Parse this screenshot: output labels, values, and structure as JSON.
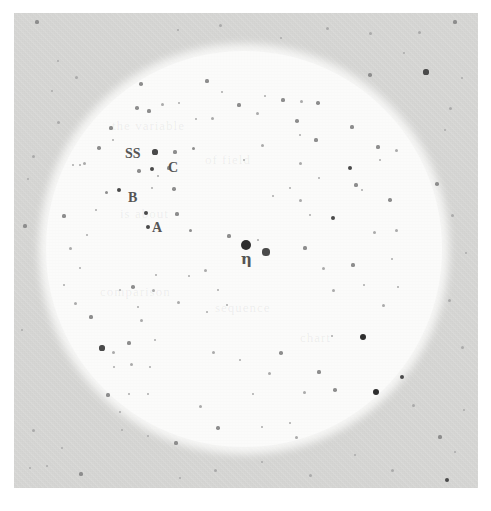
{
  "figure": {
    "kind": "astronomical-finder-chart",
    "background_color": "#d6d6d4",
    "field_color": "#fbfbfa",
    "star_color": "#4a4a4a",
    "label_color": "#555555"
  },
  "plate": {
    "left": 14,
    "top": 13,
    "width": 464,
    "height": 475
  },
  "field_of_view": {
    "center_x": 244,
    "center_y": 249,
    "radius": 198
  },
  "labels": [
    {
      "id": "ss",
      "text": "SS",
      "x": 125,
      "y": 147,
      "class": "label-ss"
    },
    {
      "id": "c",
      "text": "C",
      "x": 168,
      "y": 161,
      "class": "label-c"
    },
    {
      "id": "b",
      "text": "B",
      "x": 128,
      "y": 191,
      "class": "label-b"
    },
    {
      "id": "a",
      "text": "A",
      "x": 152,
      "y": 221,
      "class": "label-a"
    },
    {
      "id": "eta",
      "text": "η",
      "x": 241,
      "y": 252,
      "class": "label-eta"
    }
  ],
  "ghost_text": [
    {
      "text": "the variable",
      "x": 112,
      "y": 118,
      "rotate": 0
    },
    {
      "text": "of field",
      "x": 205,
      "y": 152,
      "rotate": 0
    },
    {
      "text": "is about",
      "x": 120,
      "y": 206,
      "rotate": 0
    },
    {
      "text": "comparison",
      "x": 100,
      "y": 284,
      "rotate": 0
    },
    {
      "text": "sequence",
      "x": 215,
      "y": 300,
      "rotate": 0
    },
    {
      "text": "chart",
      "x": 300,
      "y": 330,
      "rotate": 0
    }
  ],
  "stars": [
    {
      "x": 246,
      "y": 245,
      "r": 5.0,
      "mag": "bright"
    },
    {
      "x": 266,
      "y": 252,
      "r": 3.6,
      "mag": "normal"
    },
    {
      "x": 229,
      "y": 236,
      "r": 1.6,
      "mag": "dim"
    },
    {
      "x": 258,
      "y": 240,
      "r": 1.4,
      "mag": "faint"
    },
    {
      "x": 155,
      "y": 152,
      "r": 2.6,
      "mag": "normal"
    },
    {
      "x": 175,
      "y": 152,
      "r": 1.6,
      "mag": "dim"
    },
    {
      "x": 193,
      "y": 148,
      "r": 1.5,
      "mag": "dim"
    },
    {
      "x": 169,
      "y": 168,
      "r": 1.6,
      "mag": "dim"
    },
    {
      "x": 152,
      "y": 169,
      "r": 2.0,
      "mag": "normal"
    },
    {
      "x": 139,
      "y": 171,
      "r": 1.7,
      "mag": "dim"
    },
    {
      "x": 158,
      "y": 176,
      "r": 1.3,
      "mag": "faint"
    },
    {
      "x": 119,
      "y": 190,
      "r": 2.1,
      "mag": "normal"
    },
    {
      "x": 106,
      "y": 192,
      "r": 1.5,
      "mag": "dim"
    },
    {
      "x": 152,
      "y": 188,
      "r": 1.2,
      "mag": "faint"
    },
    {
      "x": 174,
      "y": 189,
      "r": 1.7,
      "mag": "dim"
    },
    {
      "x": 146,
      "y": 213,
      "r": 2.0,
      "mag": "normal"
    },
    {
      "x": 148,
      "y": 227,
      "r": 2.2,
      "mag": "normal"
    },
    {
      "x": 177,
      "y": 214,
      "r": 1.6,
      "mag": "dim"
    },
    {
      "x": 190,
      "y": 230,
      "r": 1.5,
      "mag": "dim"
    },
    {
      "x": 137,
      "y": 108,
      "r": 1.8,
      "mag": "dim"
    },
    {
      "x": 149,
      "y": 111,
      "r": 1.6,
      "mag": "dim"
    },
    {
      "x": 162,
      "y": 104,
      "r": 1.5,
      "mag": "faint"
    },
    {
      "x": 179,
      "y": 103,
      "r": 1.4,
      "mag": "faint"
    },
    {
      "x": 141,
      "y": 84,
      "r": 1.8,
      "mag": "dim"
    },
    {
      "x": 111,
      "y": 128,
      "r": 1.6,
      "mag": "dim"
    },
    {
      "x": 113,
      "y": 140,
      "r": 1.3,
      "mag": "faint"
    },
    {
      "x": 99,
      "y": 148,
      "r": 1.7,
      "mag": "dim"
    },
    {
      "x": 84,
      "y": 163,
      "r": 1.5,
      "mag": "faint"
    },
    {
      "x": 80,
      "y": 165,
      "r": 1.4,
      "mag": "faint"
    },
    {
      "x": 73,
      "y": 165,
      "r": 1.4,
      "mag": "faint"
    },
    {
      "x": 207,
      "y": 81,
      "r": 1.6,
      "mag": "dim"
    },
    {
      "x": 222,
      "y": 92,
      "r": 1.4,
      "mag": "faint"
    },
    {
      "x": 212,
      "y": 118,
      "r": 1.5,
      "mag": "faint"
    },
    {
      "x": 196,
      "y": 119,
      "r": 1.3,
      "mag": "faint"
    },
    {
      "x": 239,
      "y": 105,
      "r": 1.6,
      "mag": "dim"
    },
    {
      "x": 257,
      "y": 113,
      "r": 1.5,
      "mag": "faint"
    },
    {
      "x": 265,
      "y": 96,
      "r": 1.3,
      "mag": "faint"
    },
    {
      "x": 283,
      "y": 100,
      "r": 1.6,
      "mag": "dim"
    },
    {
      "x": 297,
      "y": 121,
      "r": 1.8,
      "mag": "dim"
    },
    {
      "x": 301,
      "y": 101,
      "r": 1.5,
      "mag": "faint"
    },
    {
      "x": 300,
      "y": 135,
      "r": 1.4,
      "mag": "faint"
    },
    {
      "x": 318,
      "y": 103,
      "r": 1.7,
      "mag": "dim"
    },
    {
      "x": 352,
      "y": 127,
      "r": 1.6,
      "mag": "dim"
    },
    {
      "x": 370,
      "y": 75,
      "r": 1.8,
      "mag": "dim"
    },
    {
      "x": 350,
      "y": 168,
      "r": 2.0,
      "mag": "normal"
    },
    {
      "x": 378,
      "y": 147,
      "r": 1.6,
      "mag": "dim"
    },
    {
      "x": 396,
      "y": 150,
      "r": 1.5,
      "mag": "faint"
    },
    {
      "x": 380,
      "y": 160,
      "r": 1.4,
      "mag": "faint"
    },
    {
      "x": 300,
      "y": 163,
      "r": 1.5,
      "mag": "faint"
    },
    {
      "x": 319,
      "y": 178,
      "r": 1.4,
      "mag": "faint"
    },
    {
      "x": 262,
      "y": 145,
      "r": 1.5,
      "mag": "faint"
    },
    {
      "x": 244,
      "y": 160,
      "r": 1.3,
      "mag": "faint"
    },
    {
      "x": 316,
      "y": 140,
      "r": 1.6,
      "mag": "dim"
    },
    {
      "x": 356,
      "y": 185,
      "r": 1.6,
      "mag": "dim"
    },
    {
      "x": 333,
      "y": 218,
      "r": 2.0,
      "mag": "normal"
    },
    {
      "x": 362,
      "y": 190,
      "r": 1.4,
      "mag": "faint"
    },
    {
      "x": 390,
      "y": 200,
      "r": 1.7,
      "mag": "dim"
    },
    {
      "x": 396,
      "y": 230,
      "r": 1.5,
      "mag": "faint"
    },
    {
      "x": 374,
      "y": 232,
      "r": 1.5,
      "mag": "faint"
    },
    {
      "x": 300,
      "y": 200,
      "r": 1.5,
      "mag": "faint"
    },
    {
      "x": 310,
      "y": 215,
      "r": 1.4,
      "mag": "faint"
    },
    {
      "x": 290,
      "y": 188,
      "r": 1.4,
      "mag": "faint"
    },
    {
      "x": 273,
      "y": 196,
      "r": 1.3,
      "mag": "faint"
    },
    {
      "x": 305,
      "y": 248,
      "r": 1.6,
      "mag": "dim"
    },
    {
      "x": 323,
      "y": 268,
      "r": 1.5,
      "mag": "faint"
    },
    {
      "x": 333,
      "y": 290,
      "r": 1.5,
      "mag": "faint"
    },
    {
      "x": 353,
      "y": 265,
      "r": 1.6,
      "mag": "dim"
    },
    {
      "x": 364,
      "y": 285,
      "r": 1.4,
      "mag": "faint"
    },
    {
      "x": 383,
      "y": 305,
      "r": 1.5,
      "mag": "faint"
    },
    {
      "x": 392,
      "y": 259,
      "r": 1.4,
      "mag": "faint"
    },
    {
      "x": 398,
      "y": 287,
      "r": 1.4,
      "mag": "faint"
    },
    {
      "x": 363,
      "y": 337,
      "r": 3.4,
      "mag": "bright"
    },
    {
      "x": 402,
      "y": 377,
      "r": 2.4,
      "mag": "normal"
    },
    {
      "x": 376,
      "y": 392,
      "r": 3.3,
      "mag": "bright"
    },
    {
      "x": 413,
      "y": 405,
      "r": 1.5,
      "mag": "faint"
    },
    {
      "x": 335,
      "y": 390,
      "r": 1.8,
      "mag": "dim"
    },
    {
      "x": 319,
      "y": 372,
      "r": 1.6,
      "mag": "dim"
    },
    {
      "x": 304,
      "y": 392,
      "r": 1.5,
      "mag": "faint"
    },
    {
      "x": 332,
      "y": 336,
      "r": 1.4,
      "mag": "faint"
    },
    {
      "x": 281,
      "y": 353,
      "r": 1.8,
      "mag": "dim"
    },
    {
      "x": 269,
      "y": 373,
      "r": 1.5,
      "mag": "faint"
    },
    {
      "x": 253,
      "y": 394,
      "r": 1.4,
      "mag": "faint"
    },
    {
      "x": 240,
      "y": 360,
      "r": 1.3,
      "mag": "faint"
    },
    {
      "x": 213,
      "y": 352,
      "r": 1.5,
      "mag": "faint"
    },
    {
      "x": 218,
      "y": 428,
      "r": 1.7,
      "mag": "dim"
    },
    {
      "x": 200,
      "y": 406,
      "r": 1.5,
      "mag": "faint"
    },
    {
      "x": 262,
      "y": 427,
      "r": 1.4,
      "mag": "faint"
    },
    {
      "x": 290,
      "y": 423,
      "r": 1.4,
      "mag": "faint"
    },
    {
      "x": 296,
      "y": 437,
      "r": 1.5,
      "mag": "faint"
    },
    {
      "x": 178,
      "y": 302,
      "r": 1.5,
      "mag": "faint"
    },
    {
      "x": 133,
      "y": 287,
      "r": 1.8,
      "mag": "dim"
    },
    {
      "x": 153,
      "y": 290,
      "r": 1.5,
      "mag": "faint"
    },
    {
      "x": 120,
      "y": 290,
      "r": 1.4,
      "mag": "faint"
    },
    {
      "x": 205,
      "y": 270,
      "r": 1.5,
      "mag": "faint"
    },
    {
      "x": 189,
      "y": 276,
      "r": 1.4,
      "mag": "faint"
    },
    {
      "x": 156,
      "y": 275,
      "r": 1.4,
      "mag": "faint"
    },
    {
      "x": 218,
      "y": 290,
      "r": 1.4,
      "mag": "faint"
    },
    {
      "x": 227,
      "y": 305,
      "r": 1.4,
      "mag": "faint"
    },
    {
      "x": 207,
      "y": 312,
      "r": 1.3,
      "mag": "faint"
    },
    {
      "x": 138,
      "y": 307,
      "r": 1.3,
      "mag": "faint"
    },
    {
      "x": 141,
      "y": 320,
      "r": 1.5,
      "mag": "faint"
    },
    {
      "x": 129,
      "y": 343,
      "r": 1.6,
      "mag": "dim"
    },
    {
      "x": 155,
      "y": 340,
      "r": 1.4,
      "mag": "faint"
    },
    {
      "x": 91,
      "y": 317,
      "r": 1.6,
      "mag": "dim"
    },
    {
      "x": 75,
      "y": 303,
      "r": 1.5,
      "mag": "faint"
    },
    {
      "x": 102,
      "y": 348,
      "r": 2.6,
      "mag": "normal"
    },
    {
      "x": 113,
      "y": 352,
      "r": 1.5,
      "mag": "faint"
    },
    {
      "x": 114,
      "y": 367,
      "r": 1.4,
      "mag": "faint"
    },
    {
      "x": 131,
      "y": 364,
      "r": 1.5,
      "mag": "faint"
    },
    {
      "x": 108,
      "y": 395,
      "r": 1.6,
      "mag": "dim"
    },
    {
      "x": 129,
      "y": 394,
      "r": 1.4,
      "mag": "faint"
    },
    {
      "x": 148,
      "y": 394,
      "r": 1.4,
      "mag": "faint"
    },
    {
      "x": 150,
      "y": 367,
      "r": 1.3,
      "mag": "faint"
    },
    {
      "x": 148,
      "y": 436,
      "r": 1.4,
      "mag": "faint"
    },
    {
      "x": 122,
      "y": 430,
      "r": 1.3,
      "mag": "faint"
    },
    {
      "x": 176,
      "y": 443,
      "r": 1.6,
      "mag": "dim"
    },
    {
      "x": 120,
      "y": 412,
      "r": 1.3,
      "mag": "faint"
    },
    {
      "x": 64,
      "y": 216,
      "r": 1.6,
      "mag": "dim"
    },
    {
      "x": 70,
      "y": 248,
      "r": 1.5,
      "mag": "faint"
    },
    {
      "x": 80,
      "y": 268,
      "r": 1.4,
      "mag": "faint"
    },
    {
      "x": 64,
      "y": 285,
      "r": 1.4,
      "mag": "faint"
    },
    {
      "x": 87,
      "y": 235,
      "r": 1.3,
      "mag": "faint"
    },
    {
      "x": 96,
      "y": 210,
      "r": 1.4,
      "mag": "faint"
    },
    {
      "x": 37,
      "y": 22,
      "r": 1.6,
      "mag": "dim"
    },
    {
      "x": 58,
      "y": 61,
      "r": 1.4,
      "mag": "faint"
    },
    {
      "x": 76,
      "y": 77,
      "r": 1.5,
      "mag": "faint"
    },
    {
      "x": 52,
      "y": 91,
      "r": 1.4,
      "mag": "faint"
    },
    {
      "x": 58,
      "y": 122,
      "r": 1.5,
      "mag": "faint"
    },
    {
      "x": 33,
      "y": 156,
      "r": 1.5,
      "mag": "faint"
    },
    {
      "x": 28,
      "y": 179,
      "r": 1.4,
      "mag": "faint"
    },
    {
      "x": 25,
      "y": 226,
      "r": 1.6,
      "mag": "dim"
    },
    {
      "x": 22,
      "y": 330,
      "r": 1.4,
      "mag": "faint"
    },
    {
      "x": 33,
      "y": 430,
      "r": 1.5,
      "mag": "faint"
    },
    {
      "x": 47,
      "y": 466,
      "r": 1.4,
      "mag": "faint"
    },
    {
      "x": 81,
      "y": 474,
      "r": 1.6,
      "mag": "dim"
    },
    {
      "x": 62,
      "y": 448,
      "r": 1.4,
      "mag": "faint"
    },
    {
      "x": 30,
      "y": 468,
      "r": 1.3,
      "mag": "faint"
    },
    {
      "x": 178,
      "y": 30,
      "r": 1.4,
      "mag": "faint"
    },
    {
      "x": 220,
      "y": 25,
      "r": 1.5,
      "mag": "faint"
    },
    {
      "x": 281,
      "y": 38,
      "r": 1.4,
      "mag": "faint"
    },
    {
      "x": 327,
      "y": 28,
      "r": 1.5,
      "mag": "faint"
    },
    {
      "x": 370,
      "y": 33,
      "r": 1.5,
      "mag": "faint"
    },
    {
      "x": 419,
      "y": 32,
      "r": 1.5,
      "mag": "faint"
    },
    {
      "x": 455,
      "y": 22,
      "r": 1.6,
      "mag": "dim"
    },
    {
      "x": 426,
      "y": 72,
      "r": 2.6,
      "mag": "normal"
    },
    {
      "x": 404,
      "y": 53,
      "r": 1.4,
      "mag": "faint"
    },
    {
      "x": 450,
      "y": 108,
      "r": 1.5,
      "mag": "faint"
    },
    {
      "x": 445,
      "y": 130,
      "r": 1.4,
      "mag": "faint"
    },
    {
      "x": 462,
      "y": 78,
      "r": 1.4,
      "mag": "faint"
    },
    {
      "x": 437,
      "y": 184,
      "r": 1.8,
      "mag": "dim"
    },
    {
      "x": 452,
      "y": 215,
      "r": 1.5,
      "mag": "faint"
    },
    {
      "x": 466,
      "y": 253,
      "r": 1.4,
      "mag": "faint"
    },
    {
      "x": 449,
      "y": 300,
      "r": 1.5,
      "mag": "faint"
    },
    {
      "x": 462,
      "y": 347,
      "r": 1.5,
      "mag": "faint"
    },
    {
      "x": 440,
      "y": 437,
      "r": 1.6,
      "mag": "dim"
    },
    {
      "x": 455,
      "y": 452,
      "r": 1.4,
      "mag": "faint"
    },
    {
      "x": 447,
      "y": 480,
      "r": 2.4,
      "mag": "normal"
    },
    {
      "x": 464,
      "y": 410,
      "r": 1.4,
      "mag": "faint"
    },
    {
      "x": 215,
      "y": 470,
      "r": 1.5,
      "mag": "faint"
    },
    {
      "x": 262,
      "y": 462,
      "r": 1.4,
      "mag": "faint"
    },
    {
      "x": 310,
      "y": 475,
      "r": 1.5,
      "mag": "faint"
    },
    {
      "x": 355,
      "y": 455,
      "r": 1.4,
      "mag": "faint"
    },
    {
      "x": 392,
      "y": 470,
      "r": 1.5,
      "mag": "faint"
    },
    {
      "x": 180,
      "y": 478,
      "r": 1.4,
      "mag": "faint"
    }
  ]
}
